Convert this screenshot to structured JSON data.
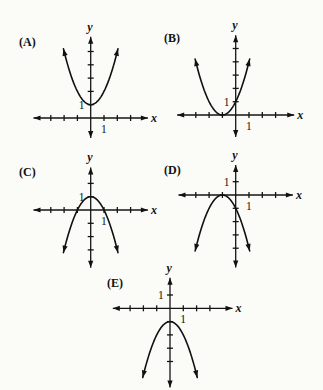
{
  "chart_data": [
    {
      "type": "line",
      "title": "(A)",
      "xlabel": "x",
      "ylabel": "y",
      "x_unit_label": "1",
      "y_unit_label": "1",
      "equation": "y = x^2 + 1",
      "coefficients": {
        "a": 1,
        "h": 0,
        "k": 1
      },
      "domain": [
        -2.05,
        2.05
      ],
      "vertex": [
        0,
        1
      ],
      "y_intercept": 1,
      "opens": "up",
      "x": [
        -2,
        -1,
        0,
        1,
        2
      ],
      "y": [
        5,
        2,
        1,
        2,
        5
      ],
      "xlim": [
        -4.3,
        4.3
      ],
      "ylim": [
        -1.5,
        6.1
      ],
      "x_ticks": [
        -3,
        -2,
        -1,
        1,
        2,
        3
      ],
      "y_ticks": [
        1,
        2,
        3,
        4,
        5
      ],
      "grid": false
    },
    {
      "type": "line",
      "title": "(B)",
      "xlabel": "x",
      "ylabel": "y",
      "x_unit_label": "1",
      "y_unit_label": "1",
      "equation": "y = (x + 1)^2",
      "coefficients": {
        "a": 1,
        "h": -1,
        "k": 0
      },
      "domain": [
        -3.05,
        1.05
      ],
      "vertex": [
        -1,
        0
      ],
      "y_intercept": 1,
      "opens": "up",
      "x": [
        -3,
        -2,
        -1,
        0,
        1
      ],
      "y": [
        4,
        1,
        0,
        1,
        4
      ],
      "xlim": [
        -4.4,
        4.4
      ],
      "ylim": [
        -1.65,
        6.0
      ],
      "x_ticks": [
        -3,
        -2,
        -1,
        1,
        2,
        3
      ],
      "y_ticks": [
        1,
        2,
        3,
        4,
        5
      ],
      "grid": false
    },
    {
      "type": "line",
      "title": "(C)",
      "xlabel": "x",
      "ylabel": "y",
      "x_unit_label": "1",
      "y_unit_label": "1",
      "equation": "y = 1 - x^2",
      "coefficients": {
        "a": -1,
        "h": 0,
        "k": 1
      },
      "domain": [
        -2.05,
        2.05
      ],
      "vertex": [
        0,
        1
      ],
      "y_intercept": 1,
      "opens": "down",
      "x": [
        -2,
        -1,
        0,
        1,
        2
      ],
      "y": [
        -3,
        0,
        1,
        0,
        -3
      ],
      "xlim": [
        -4.3,
        4.3
      ],
      "ylim": [
        -4.35,
        3.2
      ],
      "x_ticks": [
        -3,
        -2,
        -1,
        1,
        2,
        3
      ],
      "y_ticks": [
        2,
        1,
        -1,
        -2,
        -3
      ],
      "grid": false
    },
    {
      "type": "line",
      "title": "(D)",
      "xlabel": "x",
      "ylabel": "y",
      "x_unit_label": "1",
      "y_unit_label": "1",
      "equation": "y = -(x + 1)^2",
      "coefficients": {
        "a": -1,
        "h": -1,
        "k": 0
      },
      "domain": [
        -3.05,
        1.05
      ],
      "vertex": [
        -1,
        0
      ],
      "y_intercept": -1,
      "opens": "down",
      "x": [
        -3,
        -2,
        -1,
        0,
        1
      ],
      "y": [
        -4,
        -1,
        0,
        -1,
        -4
      ],
      "xlim": [
        -4.3,
        4.3
      ],
      "ylim": [
        -5.45,
        2.25
      ],
      "x_ticks": [
        -3,
        -2,
        -1,
        1,
        2,
        3
      ],
      "y_ticks": [
        1,
        -1,
        -2,
        -3,
        -4
      ],
      "grid": false
    },
    {
      "type": "line",
      "title": "(E)",
      "xlabel": "x",
      "ylabel": "y",
      "x_unit_label": "1",
      "y_unit_label": "1",
      "equation": "y = -x^2 - 1",
      "coefficients": {
        "a": -1,
        "h": 0,
        "k": -1
      },
      "domain": [
        -2.05,
        2.05
      ],
      "vertex": [
        0,
        -1
      ],
      "y_intercept": -1,
      "opens": "down",
      "x": [
        -2,
        -1,
        0,
        1,
        2
      ],
      "y": [
        -5,
        -2,
        -1,
        -2,
        -5
      ],
      "xlim": [
        -4.3,
        4.7
      ],
      "ylim": [
        -5.95,
        2.3
      ],
      "x_ticks": [
        -3,
        -2,
        -1,
        1,
        2,
        3
      ],
      "y_ticks": [
        1,
        -1,
        -2,
        -3,
        -4
      ],
      "grid": false
    }
  ]
}
